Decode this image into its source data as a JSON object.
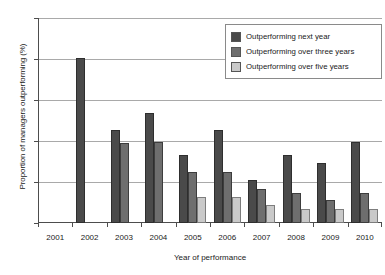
{
  "chart_data": {
    "type": "bar",
    "title": "",
    "xlabel": "Year of performance",
    "ylabel": "Proportion of managers outperforming (%)",
    "categories": [
      "2001",
      "2002",
      "2003",
      "2004",
      "2005",
      "2006",
      "2007",
      "2008",
      "2009",
      "2010"
    ],
    "series": [
      {
        "name": "Outperforming next year",
        "color": "#4a4a4a",
        "values": [
          null,
          40.3,
          22.6,
          26.8,
          16.6,
          22.7,
          10.5,
          16.7,
          14.7,
          19.8
        ]
      },
      {
        "name": "Outperforming over three years",
        "color": "#6e6e6e",
        "values": [
          null,
          null,
          19.6,
          19.7,
          12.5,
          12.5,
          8.4,
          7.4,
          5.5,
          7.4
        ]
      },
      {
        "name": "Outperforming over five years",
        "color": "#c9c9c9",
        "values": [
          null,
          null,
          null,
          null,
          6.4,
          6.4,
          4.3,
          3.4,
          3.4,
          3.4
        ]
      }
    ],
    "ylim": [
      0,
      50
    ],
    "yticks": [
      0,
      10,
      20,
      30,
      40,
      50
    ],
    "ytick_labels": [
      "0",
      "10",
      "20",
      "30",
      "40",
      "50"
    ],
    "grid": true,
    "legend_position": "top-right"
  }
}
